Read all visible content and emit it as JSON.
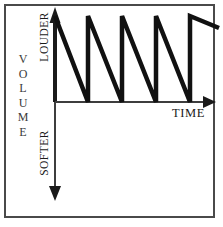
{
  "figure": {
    "border_color": "#4a4a4a",
    "ink_color": "#1a1a1a",
    "background": "#ffffff"
  },
  "labels": {
    "y_axis_name_letters": [
      "V",
      "O",
      "L",
      "U",
      "M",
      "E"
    ],
    "y_axis_name": "VOLUME",
    "y_axis_top": "LOUDER",
    "y_axis_bottom": "SOFTER",
    "x_axis": "TIME"
  },
  "chart_data": {
    "type": "line",
    "title": "",
    "xlabel": "TIME",
    "ylabel": "VOLUME",
    "ylabel_top": "LOUDER",
    "ylabel_bottom": "SOFTER",
    "grid": false,
    "legend": "none",
    "waveform": "sawtooth-falling",
    "cycles": 5,
    "period_px": 34,
    "amplitude_px": 86,
    "baseline_y_px": 102,
    "peak_y_px": 16,
    "x_start_px": 55,
    "x_end_px": 215,
    "axis_x": {
      "x1": 55,
      "y1": 102,
      "x2": 215,
      "y2": 102,
      "arrow": "end"
    },
    "axis_y": {
      "x1": 55,
      "y1": 10,
      "x2": 55,
      "y2": 200,
      "arrow": "both"
    },
    "points": [
      [
        55,
        16
      ],
      [
        88,
        102
      ],
      [
        88,
        16
      ],
      [
        122,
        102
      ],
      [
        122,
        16
      ],
      [
        156,
        102
      ],
      [
        156,
        16
      ],
      [
        190,
        102
      ],
      [
        190,
        16
      ],
      [
        219,
        28
      ]
    ],
    "series": [
      {
        "name": "volume",
        "description": "Repeating sawtooth: instantaneous rise to LOUDER peak, then linear decay toward the baseline",
        "values": [
          100,
          0,
          100,
          0,
          100,
          0,
          100,
          0,
          100,
          86
        ]
      }
    ]
  }
}
